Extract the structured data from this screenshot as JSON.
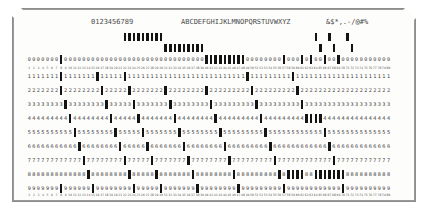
{
  "card": {
    "kind": "IBM 80-column punched card",
    "columns": 80,
    "corner_cut": "top-left and top-right",
    "printed_interpretation": {
      "digits": "0123456789",
      "letters": "ABCDEFGHIJKLMNOPQRSTUVWXYZ",
      "specials": "&$*,.-/@#%"
    },
    "row_labels": [
      "12",
      "11",
      "0",
      "1",
      "2",
      "3",
      "4",
      "5",
      "6",
      "7",
      "8",
      "9"
    ],
    "printed_digit_rows": [
      "0",
      "1",
      "2",
      "3",
      "4",
      "5",
      "6",
      "7",
      "8",
      "9"
    ],
    "column_numbers": [
      1,
      2,
      3,
      4,
      5,
      6,
      7,
      8,
      9,
      10,
      11,
      12,
      13,
      14,
      15,
      16,
      17,
      18,
      19,
      20,
      21,
      22,
      23,
      24,
      25,
      26,
      27,
      28,
      29,
      30,
      31,
      32,
      33,
      34,
      35,
      36,
      37,
      38,
      39,
      40,
      41,
      42,
      43,
      44,
      45,
      46,
      47,
      48,
      49,
      50,
      51,
      52,
      53,
      54,
      55,
      56,
      57,
      58,
      59,
      60,
      61,
      62,
      63,
      64,
      65,
      66,
      67,
      68,
      69,
      70,
      71,
      72,
      73,
      74,
      75,
      76,
      77,
      78,
      79,
      80
    ],
    "punches": {
      "row12": [
        22,
        23,
        24,
        25,
        26,
        27,
        28,
        29,
        30,
        64,
        67,
        71
      ],
      "row11": [
        31,
        32,
        33,
        34,
        35,
        36,
        37,
        38,
        39,
        65,
        68,
        72
      ],
      "row0": [
        8,
        40,
        41,
        42,
        43,
        44,
        45,
        46,
        47,
        48,
        57,
        61,
        63,
        66,
        69
      ],
      "row1": [
        8,
        16,
        22,
        49,
        59
      ],
      "row2": [
        8,
        17,
        23,
        31,
        40,
        50,
        60
      ],
      "row3": [
        9,
        18,
        24,
        32,
        41,
        51,
        61
      ],
      "row4": [
        10,
        19,
        25,
        33,
        42,
        52,
        62,
        63,
        64,
        65
      ],
      "row5": [
        11,
        20,
        26,
        34,
        43,
        53,
        66
      ],
      "row6": [
        12,
        21,
        27,
        35,
        44,
        54,
        67
      ],
      "row7": [
        13,
        22,
        28,
        36,
        45,
        55,
        68
      ],
      "row8": [
        14,
        23,
        29,
        37,
        46,
        56,
        58,
        59,
        60,
        61,
        64,
        65,
        66,
        67,
        68,
        69,
        70
      ],
      "row9": [
        8,
        15,
        24,
        30,
        38,
        47,
        57,
        70
      ]
    },
    "colors": {
      "card_face": "#fdfdfb",
      "card_border": "#8d8d8d",
      "hole": "#131313",
      "print": "#3c3c3c",
      "background": "#ffffff"
    }
  }
}
